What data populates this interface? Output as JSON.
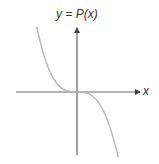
{
  "diagram": {
    "title": "y = P(x)",
    "x_axis_label": "x",
    "curve_description": "odd-degree polynomial with negative leading coefficient, flat inflection at origin",
    "colors": {
      "axis": "#555555",
      "curve": "#b0b0b0",
      "text": "#333333"
    }
  }
}
